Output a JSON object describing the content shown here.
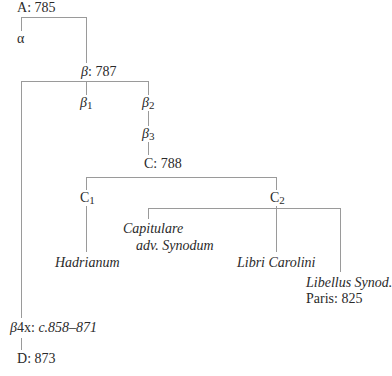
{
  "stemma": {
    "nodes": {
      "A": {
        "label": "A",
        "sep": ":",
        "date": "785"
      },
      "alpha": {
        "label": "α"
      },
      "beta": {
        "label": "β",
        "sep": ":",
        "date": "787"
      },
      "beta1": {
        "label": "β",
        "sub": "1"
      },
      "beta2": {
        "label": "β",
        "sub": "2"
      },
      "beta3": {
        "label": "β",
        "sub": "3"
      },
      "C": {
        "label": "C",
        "sep": ":",
        "date": "788"
      },
      "C1": {
        "label": "C",
        "sub": "1"
      },
      "C2": {
        "label": "C",
        "sub": "2"
      },
      "capitulare": {
        "line1": "Capitulare",
        "line2": "adv. Synodum"
      },
      "hadrianum": {
        "label": "Hadrianum"
      },
      "libri_carolini": {
        "label": "Libri Carolini"
      },
      "libellus": {
        "line1": "Libellus Synod.",
        "line2": "Paris:  825"
      },
      "beta4x": {
        "label": "β",
        "sub": "4",
        "suffix": "x",
        "sep": ":",
        "date": "c.858–871"
      },
      "D": {
        "label": "D",
        "sep": ":",
        "date": "873"
      }
    },
    "colors": {
      "text": "#2a2a2a",
      "lines": "#9a9a9a"
    }
  }
}
